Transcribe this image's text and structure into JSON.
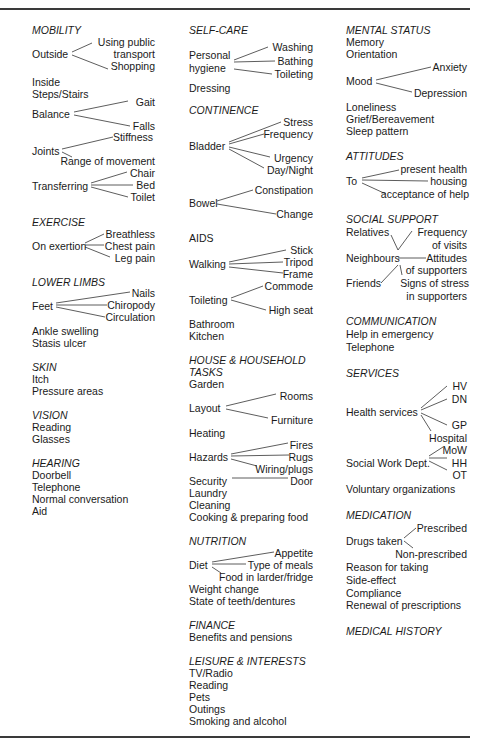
{
  "columns": [
    {
      "sections": [
        {
          "heading": "MOBILITY",
          "items": [
            "Outside",
            "Using public",
            "transport",
            "Shopping",
            "Inside",
            "Steps/Stairs",
            "Balance",
            "Gait",
            "Falls",
            "Joints",
            "Stiffness",
            "Range of movement",
            "Transferring",
            "Chair",
            "Bed",
            "Toilet"
          ]
        },
        {
          "heading": "EXERCISE",
          "items": [
            "On exertion",
            "Breathless",
            "Chest pain",
            "Leg pain"
          ]
        },
        {
          "heading": "LOWER LIMBS",
          "items": [
            "Feet",
            "Nails",
            "Chiropody",
            "Circulation",
            "Ankle swelling",
            "Stasis ulcer"
          ]
        },
        {
          "heading": "SKIN",
          "items": [
            "Itch",
            "Pressure areas"
          ]
        },
        {
          "heading": "VISION",
          "items": [
            "Reading",
            "Glasses"
          ]
        },
        {
          "heading": "HEARING",
          "items": [
            "Doorbell",
            "Telephone",
            "Normal conversation",
            "Aid"
          ]
        }
      ]
    },
    {
      "sections": [
        {
          "heading": "SELF-CARE",
          "items": [
            "Personal",
            "hygiene",
            "Washing",
            "Bathing",
            "Toileting",
            "Dressing"
          ]
        },
        {
          "heading": "CONTINENCE",
          "items": [
            "Bladder",
            "Stress",
            "Frequency",
            "Urgency",
            "Day/Night",
            "Bowel",
            "Constipation",
            "Change"
          ]
        },
        {
          "heading": "AIDS",
          "items": [
            "Walking",
            "Stick",
            "Tripod",
            "Frame",
            "Toileting",
            "Commode",
            "High seat",
            "Bathroom",
            "Kitchen"
          ]
        },
        {
          "heading": "HOUSE & HOUSEHOLD",
          "heading2": "TASKS",
          "items": [
            "Garden",
            "Layout",
            "Rooms",
            "Furniture",
            "Heating",
            "Hazards",
            "Fires",
            "Rugs",
            "Wiring/plugs",
            "Security",
            "Door",
            "Laundry",
            "Cleaning",
            "Cooking & preparing food"
          ]
        },
        {
          "heading": "NUTRITION",
          "items": [
            "Diet",
            "Appetite",
            "Type of meals",
            "Food in larder/fridge",
            "Weight change",
            "State of teeth/dentures"
          ]
        },
        {
          "heading": "FINANCE",
          "items": [
            "Benefits and pensions"
          ]
        },
        {
          "heading": "LEISURE & INTERESTS",
          "items": [
            "TV/Radio",
            "Reading",
            "Pets",
            "Outings",
            "Smoking and alcohol"
          ]
        }
      ]
    },
    {
      "sections": [
        {
          "heading": "MENTAL STATUS",
          "items": [
            "Memory",
            "Orientation",
            "Mood",
            "Anxiety",
            "Depression",
            "Loneliness",
            "Grief/Bereavement",
            "Sleep pattern"
          ]
        },
        {
          "heading": "ATTITUDES",
          "items": [
            "To",
            "present health",
            "housing",
            "acceptance of help"
          ]
        },
        {
          "heading": "SOCIAL SUPPORT",
          "items": [
            "Relatives",
            "Neighbours",
            "Friends",
            "Frequency",
            "of visits",
            "Attitudes",
            "of supporters",
            "Signs of stress",
            "in supporters"
          ]
        },
        {
          "heading": "COMMUNICATION",
          "items": [
            "Help in emergency",
            "Telephone"
          ]
        },
        {
          "heading": "SERVICES",
          "items": [
            "Health services",
            "HV",
            "DN",
            "GP",
            "Hospital",
            "Social Work Dept.",
            "MoW",
            "HH",
            "OT",
            "Voluntary organizations"
          ]
        },
        {
          "heading": "MEDICATION",
          "items": [
            "Drugs taken",
            "Prescribed",
            "Non-prescribed",
            "Reason for taking",
            "Side-effect",
            "Compliance",
            "Renewal of prescriptions"
          ]
        },
        {
          "heading": "MEDICAL HISTORY",
          "items": []
        }
      ]
    }
  ]
}
